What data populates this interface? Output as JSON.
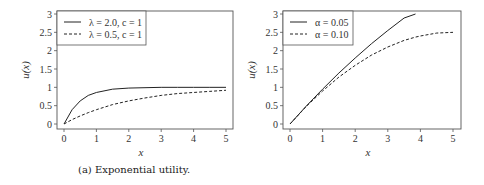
{
  "chart_data": [
    {
      "type": "line",
      "title": "",
      "caption": "(a) Exponential utility.",
      "xlabel": "x",
      "ylabel": "u(x)",
      "xlim": [
        0,
        5
      ],
      "ylim": [
        0,
        3
      ],
      "xticks": [
        "0",
        "1",
        "2",
        "3",
        "4",
        "5"
      ],
      "yticks": [
        "0",
        "0.5",
        "1",
        "1.5",
        "2",
        "2.5",
        "3"
      ],
      "grid": false,
      "legend_position": "upper left",
      "x": [
        0,
        0.25,
        0.5,
        0.75,
        1,
        1.5,
        2,
        2.5,
        3,
        3.5,
        4,
        4.5,
        5
      ],
      "series": [
        {
          "name": "λ = 2.0, c = 1",
          "style": "solid",
          "values": [
            0,
            0.39,
            0.63,
            0.78,
            0.86,
            0.95,
            0.98,
            0.99,
            1.0,
            1.0,
            1.0,
            1.0,
            1.0
          ]
        },
        {
          "name": "λ = 0.5, c = 1",
          "style": "dashed",
          "values": [
            0,
            0.12,
            0.22,
            0.31,
            0.39,
            0.53,
            0.63,
            0.71,
            0.78,
            0.83,
            0.86,
            0.89,
            0.92
          ]
        }
      ]
    },
    {
      "type": "line",
      "title": "",
      "caption": "(b) Quadratic utility.",
      "xlabel": "x",
      "ylabel": "u(x)",
      "xlim": [
        0,
        5
      ],
      "ylim": [
        0,
        3
      ],
      "xticks": [
        "0",
        "1",
        "2",
        "3",
        "4",
        "5"
      ],
      "yticks": [
        "0",
        "0.5",
        "1",
        "1.5",
        "2",
        "2.5",
        "3"
      ],
      "grid": false,
      "legend_position": "upper left",
      "x": [
        0,
        0.5,
        1,
        1.5,
        2,
        2.5,
        3,
        3.5,
        3.85,
        4,
        4.5,
        5
      ],
      "series": [
        {
          "name": "α = 0.05",
          "style": "solid",
          "values": [
            0,
            0.49,
            0.95,
            1.39,
            1.8,
            2.19,
            2.55,
            2.89,
            3.0,
            null,
            null,
            null
          ]
        },
        {
          "name": "α = 0.10",
          "style": "dashed",
          "values": [
            0,
            0.48,
            0.9,
            1.28,
            1.6,
            1.88,
            2.1,
            2.28,
            2.37,
            2.4,
            2.48,
            2.5
          ]
        }
      ]
    }
  ],
  "panels": {
    "a": {
      "caption": "(a) Exponential utility.",
      "xlabel": "x",
      "ylabel": "u(x)",
      "legend": [
        "λ = 2.0, c = 1",
        "λ = 0.5, c = 1"
      ]
    },
    "b": {
      "caption": "(b) Quadratic utility.",
      "xlabel": "x",
      "ylabel": "u(x)",
      "legend": [
        "α = 0.05",
        "α = 0.10"
      ]
    }
  },
  "colors": {
    "line": "#222222",
    "frame": "#555555",
    "background": "#ffffff"
  }
}
